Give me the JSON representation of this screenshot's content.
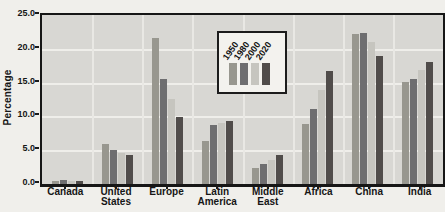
{
  "chart_data": {
    "type": "bar",
    "title": "",
    "xlabel": "",
    "ylabel": "Percentage",
    "ymin": 0,
    "ymax": 25,
    "ytick_labels": [
      "25.0",
      "20.0",
      "15.0",
      "10.0",
      "5.0",
      "0.0"
    ],
    "grid": true,
    "legend_position": "top-center-inside",
    "categories": [
      [
        "Canada"
      ],
      [
        "United",
        "States"
      ],
      [
        "Europe"
      ],
      [
        "Latin",
        "America"
      ],
      [
        "Middle",
        "East"
      ],
      [
        "Africa"
      ],
      [
        "China"
      ],
      [
        "India"
      ]
    ],
    "series": [
      {
        "name": "1950",
        "color": "#98978f",
        "values": [
          0.5,
          5.9,
          21.6,
          6.3,
          2.3,
          8.9,
          22.2,
          15.1
        ]
      },
      {
        "name": "1980",
        "color": "#6e6e70",
        "values": [
          0.6,
          5.0,
          15.5,
          8.8,
          3.0,
          11.1,
          22.3,
          15.6
        ]
      },
      {
        "name": "2000",
        "color": "#c6c5bf",
        "values": [
          0.4,
          4.6,
          12.6,
          9.0,
          3.6,
          13.9,
          21.0,
          16.9
        ]
      },
      {
        "name": "2020",
        "color": "#504c4a",
        "values": [
          0.5,
          4.3,
          9.9,
          9.3,
          4.3,
          16.7,
          19.0,
          18.1
        ]
      }
    ]
  },
  "colors": {
    "plot_background": "#d8d7d3",
    "page_background": "#f0efeb",
    "axis": "#161616",
    "gridline": "#efeeea"
  }
}
